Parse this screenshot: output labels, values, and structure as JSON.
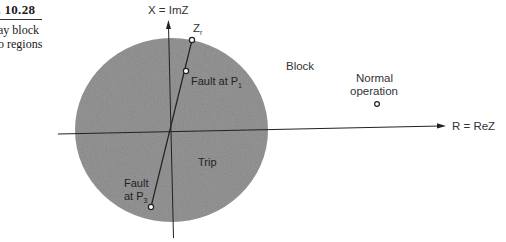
{
  "caption": {
    "title": "FIGURE 10.28",
    "visible_title": "E 10.28",
    "lines": [
      "ay block",
      "o regions"
    ]
  },
  "axes": {
    "x_label": "R = ReZ",
    "y_label": "X = ImZ"
  },
  "regions": {
    "block_label": "Block",
    "trip_label": "Trip"
  },
  "points": {
    "zr_label": "Z",
    "zr_sub": "r",
    "fault_p1_label": "Fault at P",
    "fault_p1_sub": "1",
    "fault_p3_line1": "Fault",
    "fault_p3_label": "at P",
    "fault_p3_sub": "3",
    "normal_line1": "Normal",
    "normal_line2": "operation"
  },
  "colors": {
    "trip_region_fill": "#8a8a8a",
    "axis_color": "#222222",
    "text_color": "#333333"
  }
}
